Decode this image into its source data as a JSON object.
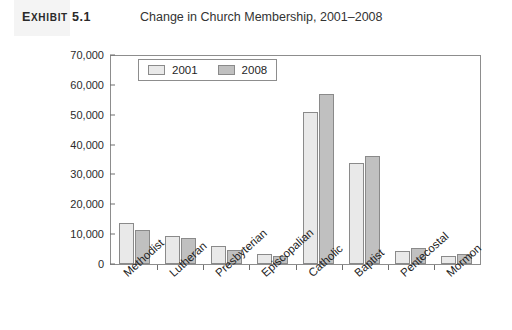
{
  "header": {
    "exhibit_tag": "Exhibit 5.1",
    "exhibit_tag_lead": "E",
    "exhibit_tag_rest": "XHIBIT",
    "exhibit_number": "5.1",
    "title": "Change in Church Membership, 2001–2008"
  },
  "chart_data": {
    "type": "bar",
    "title": "Change in Church Membership, 2001–2008",
    "xlabel": "",
    "ylabel": "",
    "ylim": [
      0,
      70000
    ],
    "ytick_values": [
      0,
      10000,
      20000,
      30000,
      40000,
      50000,
      60000,
      70000
    ],
    "ytick_labels": [
      "0",
      "10,000",
      "20,000",
      "30,000",
      "40,000",
      "50,000",
      "60,000",
      "70,000"
    ],
    "grid": false,
    "legend_position": "top-left-inside",
    "categories": [
      "Methodist",
      "Lutheran",
      "Presbyterian",
      "Episcopalian",
      "Catholic",
      "Baptist",
      "Pentecostal",
      "Mormon"
    ],
    "series": [
      {
        "name": "2001",
        "color": "#e9e9e9",
        "values": [
          13800,
          9500,
          6000,
          3400,
          51000,
          34000,
          4400,
          2700
        ]
      },
      {
        "name": "2008",
        "color": "#c0c0c0",
        "values": [
          11400,
          8600,
          4800,
          2600,
          57000,
          36200,
          5400,
          3200
        ]
      }
    ]
  }
}
